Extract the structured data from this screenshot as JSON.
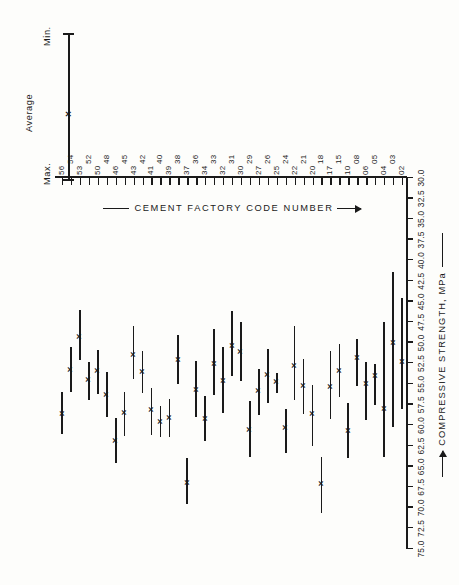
{
  "figure": {
    "orientation": "rotated-90-ccw",
    "ink_color": "#1a1a1a",
    "background_color": "#fdfdfb"
  },
  "legend": {
    "max_label": "Max.",
    "average_label": "Average",
    "min_label": "Min.",
    "average_marker": "×"
  },
  "axes": {
    "value_axis_title": "COMPRESSIVE STRENGTH, MPa",
    "category_axis_title": "CEMENT FACTORY CODE NUMBER",
    "value_ticks": [
      "75.0",
      "72.5",
      "70.0",
      "67.5",
      "65.0",
      "62.5",
      "60.0",
      "57.5",
      "55.0",
      "52.5",
      "50.0",
      "47.5",
      "45.0",
      "42.5",
      "40.0",
      "37.5",
      "35.0",
      "32.5",
      "30.0"
    ]
  },
  "chart_data": {
    "type": "bar",
    "subtype": "horizontal range (min-average-max) plot",
    "title": "",
    "xlabel": "COMPRESSIVE STRENGTH, MPa",
    "ylabel": "CEMENT FACTORY CODE NUMBER",
    "xlim": [
      30.0,
      75.0
    ],
    "xtick_step": 2.5,
    "grid": false,
    "legend_position": "top-left",
    "categories": [
      "02",
      "03",
      "04",
      "05",
      "06",
      "08",
      "10",
      "15",
      "17",
      "18",
      "20",
      "21",
      "22",
      "24",
      "25",
      "26",
      "27",
      "29",
      "30",
      "31",
      "32",
      "33",
      "34",
      "36",
      "37",
      "38",
      "39",
      "40",
      "41",
      "42",
      "43",
      "45",
      "46",
      "48",
      "50",
      "52",
      "53",
      "54",
      "56"
    ],
    "series": [
      {
        "name": "Minimum",
        "values": [
          44.6,
          41.4,
          47.5,
          52.5,
          52.3,
          49.5,
          57.3,
          50.1,
          51.0,
          63.8,
          55.1,
          52.0,
          48.0,
          58.0,
          53.6,
          50.8,
          53.2,
          57.1,
          47.5,
          46.1,
          50.5,
          48.3,
          56.5,
          52.2,
          64.0,
          49.0,
          56.8,
          57.6,
          55.5,
          51.0,
          48.0,
          55.9,
          59.1,
          53.5,
          50.9,
          52.3,
          46.0,
          50.5,
          56.0
        ]
      },
      {
        "name": "Average",
        "values": [
          52.2,
          50.0,
          57.9,
          54.0,
          54.9,
          51.8,
          60.6,
          53.3,
          55.3,
          67.0,
          58.6,
          55.2,
          52.8,
          60.3,
          54.7,
          53.8,
          55.8,
          60.5,
          51.1,
          50.3,
          54.6,
          52.5,
          59.2,
          55.6,
          66.9,
          52.0,
          59.0,
          59.5,
          58.1,
          53.5,
          51.4,
          58.4,
          61.8,
          56.3,
          53.4,
          54.5,
          49.2,
          53.2,
          58.6
        ]
      },
      {
        "name": "Maximum",
        "values": [
          58.0,
          60.2,
          63.8,
          57.5,
          59.4,
          55.2,
          64.0,
          56.6,
          59.2,
          70.6,
          62.5,
          58.6,
          56.9,
          63.4,
          56.1,
          57.3,
          58.8,
          63.9,
          54.6,
          54.0,
          58.5,
          56.3,
          61.9,
          59.0,
          69.5,
          55.0,
          61.4,
          61.4,
          61.2,
          56.1,
          54.4,
          61.3,
          64.6,
          59.0,
          56.2,
          56.9,
          52.1,
          55.9,
          61.1
        ]
      }
    ]
  }
}
